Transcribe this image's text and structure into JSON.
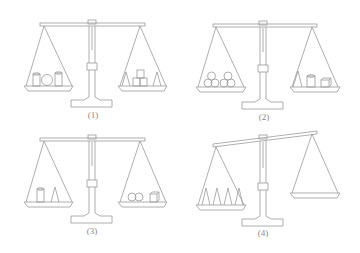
{
  "figure": {
    "stroke_color": "#9a9a9a",
    "panels": [
      {
        "label": "(1)",
        "state": "balanced",
        "left_pan": [
          "cylinder",
          "sphere",
          "cylinder"
        ],
        "right_pan": [
          "cone",
          "cube",
          "cube",
          "cube",
          "cone"
        ]
      },
      {
        "label": "(2)",
        "state": "balanced",
        "left_pan": [
          "sphere",
          "sphere",
          "sphere",
          "sphere",
          "sphere",
          "sphere"
        ],
        "right_pan": [
          "cone",
          "cylinder",
          "cube"
        ]
      },
      {
        "label": "(3)",
        "state": "balanced",
        "left_pan": [
          "cylinder",
          "cone"
        ],
        "right_pan": [
          "sphere",
          "sphere",
          "cube"
        ]
      },
      {
        "label": "(4)",
        "state": "tilted-left-down",
        "left_pan": [
          "cone",
          "cone",
          "cone",
          "cone"
        ],
        "right_pan": []
      }
    ]
  }
}
